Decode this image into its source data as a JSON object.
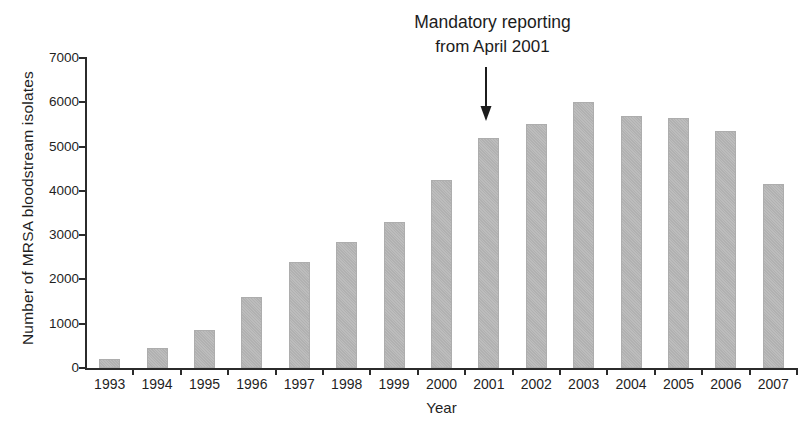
{
  "chart_data": {
    "type": "bar",
    "title": "",
    "annotation": {
      "line1": "Mandatory reporting",
      "line2": "from April 2001",
      "points_to_category": "2001"
    },
    "categories": [
      "1993",
      "1994",
      "1995",
      "1996",
      "1997",
      "1998",
      "1999",
      "2000",
      "2001",
      "2002",
      "2003",
      "2004",
      "2005",
      "2006",
      "2007"
    ],
    "values": [
      200,
      450,
      850,
      1600,
      2400,
      2850,
      3300,
      4250,
      5200,
      5500,
      6000,
      5700,
      5650,
      5350,
      4150
    ],
    "xlabel": "Year",
    "ylabel": "Number of MRSA bloodstream isolates",
    "ylim": [
      0,
      7000
    ],
    "yticks": [
      0,
      1000,
      2000,
      3000,
      4000,
      5000,
      6000,
      7000
    ],
    "grid": false,
    "legend_position": "none",
    "bar_color": "#b9b9b9",
    "bar_edge_color": "#adadad",
    "axis_color": "#2b2b2b",
    "text_color": "#1f1f1f"
  }
}
